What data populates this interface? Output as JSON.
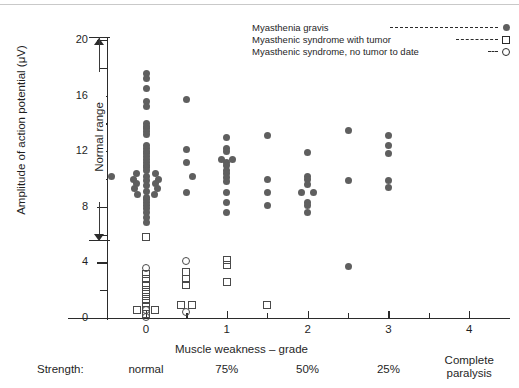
{
  "chart_data": {
    "type": "scatter",
    "title": "",
    "xlabel": "Muscle weakness – grade",
    "ylabel": "Amplitude of action potential (μV)",
    "xlim": [
      -0.45,
      4.3
    ],
    "ylim": [
      0,
      21.5
    ],
    "yticks": [
      0,
      4,
      8,
      12,
      16,
      20
    ],
    "ytick_minor": [
      2,
      6,
      10,
      14,
      18
    ],
    "xticks": [
      0,
      1,
      2,
      3,
      4
    ],
    "xtick_minor": [
      0.5,
      1.5,
      2.5,
      3.5
    ],
    "grid": false,
    "legend_position": "top-right",
    "annotations": [
      {
        "name": "normal-range",
        "label": "Normal range",
        "y_from": 5.0,
        "y_to": 20.0,
        "style": "double-headed-arrow"
      }
    ],
    "secondary_axis": {
      "label": "Strength:",
      "categories": [
        "normal",
        "75%",
        "50%",
        "25%",
        "Complete paralysis"
      ],
      "at_x": [
        0,
        1,
        2,
        3,
        4
      ]
    },
    "series": [
      {
        "name": "Myasthenia gravis",
        "marker": "filled-circle",
        "color": "#5f5f5f",
        "points": [
          [
            0,
            17.6
          ],
          [
            0,
            17.2
          ],
          [
            0,
            16.5
          ],
          [
            0,
            15.6
          ],
          [
            0,
            15.2
          ],
          [
            0,
            14.0
          ],
          [
            0,
            13.8
          ],
          [
            0,
            13.6
          ],
          [
            0,
            13.4
          ],
          [
            0,
            13.2
          ],
          [
            0,
            12.4
          ],
          [
            0,
            12.2
          ],
          [
            0,
            12.0
          ],
          [
            0,
            11.8
          ],
          [
            0,
            11.6
          ],
          [
            0,
            11.4
          ],
          [
            0,
            11.2
          ],
          [
            0,
            11.0
          ],
          [
            0,
            10.8
          ],
          [
            0,
            10.6
          ],
          [
            -0.12,
            10.4
          ],
          [
            0.12,
            10.4
          ],
          [
            0,
            10.2
          ],
          [
            -0.15,
            10.0
          ],
          [
            0.15,
            10.0
          ],
          [
            0,
            9.9
          ],
          [
            -0.12,
            9.7
          ],
          [
            0.12,
            9.7
          ],
          [
            0,
            9.5
          ],
          [
            -0.14,
            9.3
          ],
          [
            0.14,
            9.3
          ],
          [
            0,
            9.1
          ],
          [
            -0.1,
            8.9
          ],
          [
            0.1,
            8.9
          ],
          [
            0,
            8.7
          ],
          [
            0,
            8.5
          ],
          [
            0,
            8.3
          ],
          [
            0,
            8.1
          ],
          [
            0,
            7.9
          ],
          [
            0,
            7.6
          ],
          [
            0,
            7.2
          ],
          [
            0,
            6.9
          ],
          [
            0.5,
            15.7
          ],
          [
            0.5,
            12.1
          ],
          [
            0.5,
            11.2
          ],
          [
            -0.43,
            10.2
          ],
          [
            0.57,
            10.2
          ],
          [
            0.5,
            9.0
          ],
          [
            1,
            13.0
          ],
          [
            1,
            12.2
          ],
          [
            1,
            12.0
          ],
          [
            0.93,
            11.4
          ],
          [
            1.07,
            11.4
          ],
          [
            1,
            11.2
          ],
          [
            1,
            11.0
          ],
          [
            1,
            10.6
          ],
          [
            1,
            10.4
          ],
          [
            1,
            10.1
          ],
          [
            1,
            9.8
          ],
          [
            1,
            9.0
          ],
          [
            1,
            8.3
          ],
          [
            1,
            7.6
          ],
          [
            1.5,
            13.1
          ],
          [
            1.5,
            10.0
          ],
          [
            1.5,
            9.0
          ],
          [
            1.5,
            8.1
          ],
          [
            2,
            11.9
          ],
          [
            2,
            10.2
          ],
          [
            2,
            10.0
          ],
          [
            2,
            9.6
          ],
          [
            1.93,
            9.0
          ],
          [
            2.07,
            9.0
          ],
          [
            2,
            8.3
          ],
          [
            2,
            8.1
          ],
          [
            2,
            7.6
          ],
          [
            2.5,
            13.5
          ],
          [
            2.5,
            9.9
          ],
          [
            2.5,
            3.7
          ],
          [
            3,
            13.1
          ],
          [
            3,
            12.4
          ],
          [
            3,
            11.8
          ],
          [
            3,
            9.9
          ],
          [
            3,
            9.4
          ]
        ]
      },
      {
        "name": "Myasthenic syndrome with tumor",
        "marker": "open-square",
        "color": "#4a4a4a",
        "points": [
          [
            0,
            5.8
          ],
          [
            0,
            3.2
          ],
          [
            0,
            2.8
          ],
          [
            0,
            2.4
          ],
          [
            0,
            2.0
          ],
          [
            0,
            1.7
          ],
          [
            0,
            1.4
          ],
          [
            0,
            1.1
          ],
          [
            0,
            0.8
          ],
          [
            -0.11,
            0.55
          ],
          [
            0.11,
            0.55
          ],
          [
            0,
            0.3
          ],
          [
            0.5,
            3.3
          ],
          [
            0.5,
            2.8
          ],
          [
            0.5,
            2.4
          ],
          [
            0.43,
            0.9
          ],
          [
            0.57,
            0.9
          ],
          [
            1,
            4.2
          ],
          [
            1,
            3.8
          ],
          [
            1,
            2.6
          ],
          [
            1.5,
            0.9
          ]
        ]
      },
      {
        "name": "Myasthenic syndrome, no tumor to date",
        "marker": "open-circle",
        "color": "#4a4a4a",
        "points": [
          [
            0,
            3.6
          ],
          [
            0,
            0.55
          ],
          [
            0,
            0.1
          ],
          [
            0.5,
            4.1
          ],
          [
            0.5,
            0.45
          ]
        ]
      }
    ]
  },
  "legend": {
    "items": [
      {
        "label": "Myasthenia gravis",
        "marker": "filled-circle",
        "dash_width": 108
      },
      {
        "label": "Myasthenic syndrome with tumor",
        "marker": "open-square",
        "dash_width": 42
      },
      {
        "label": "Myasthenic syndrome, no tumor to date",
        "marker": "open-circle",
        "dash_width": 10
      }
    ]
  }
}
